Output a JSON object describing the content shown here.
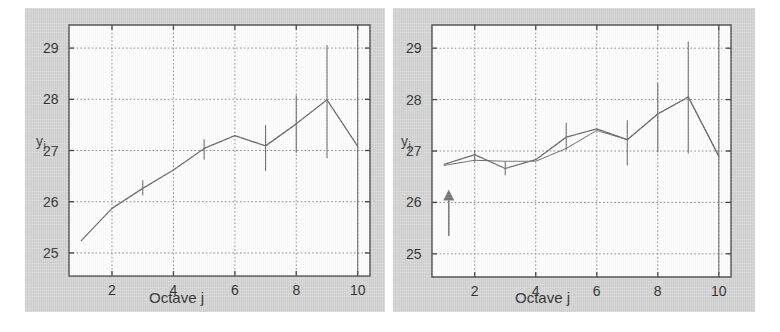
{
  "figure": {
    "background": "#d4d4d4",
    "plot_background": "#ffffff",
    "line_color": "#6b6b6b",
    "grid_color": "#8a8a8a",
    "axis_color": "#4a4a4a",
    "arrow_color": "#777777"
  },
  "panels": [
    {
      "id": "left",
      "name": "panel-left",
      "axis": {
        "xlabel": "Octave j",
        "ylabel": "y",
        "ylabel_sub": "j",
        "xticks": [
          "2",
          "4",
          "6",
          "8",
          "10"
        ],
        "xtick_values": [
          2,
          4,
          6,
          8,
          10
        ],
        "yticks": [
          "25",
          "26",
          "27",
          "28",
          "29"
        ],
        "ytick_values": [
          25,
          26,
          27,
          28,
          29
        ],
        "xlim": [
          0.6,
          10.4
        ],
        "ylim": [
          24.55,
          29.45
        ],
        "grid": true
      }
    },
    {
      "id": "right",
      "name": "panel-right",
      "axis": {
        "xlabel": "Octave j",
        "ylabel": "y",
        "ylabel_sub": "j",
        "xticks": [
          "2",
          "4",
          "6",
          "8",
          "10"
        ],
        "xtick_values": [
          2,
          4,
          6,
          8,
          10
        ],
        "yticks": [
          "25",
          "26",
          "27",
          "28",
          "29"
        ],
        "ytick_values": [
          25,
          26,
          27,
          28,
          29
        ],
        "xlim": [
          0.6,
          10.4
        ],
        "ylim": [
          24.55,
          29.45
        ],
        "grid": true
      },
      "annotation": {
        "type": "up-arrow",
        "name": "up-arrow-annotation",
        "x": 1.15,
        "y_tail": 25.35,
        "y_tip": 26.25
      }
    }
  ],
  "chart_data": [
    {
      "type": "line",
      "panel": "left",
      "title": "",
      "xlabel": "Octave j",
      "ylabel": "y_j",
      "xlim": [
        0.6,
        10.4
      ],
      "ylim": [
        24.55,
        29.45
      ],
      "grid": true,
      "legend": "none",
      "x": [
        1,
        2,
        3,
        4,
        5,
        6,
        7,
        8,
        9,
        10
      ],
      "series": [
        {
          "name": "y_j estimate",
          "values": [
            25.24,
            25.87,
            26.26,
            26.62,
            27.04,
            27.29,
            27.09,
            27.52,
            27.99,
            27.08
          ],
          "errorbars_low": [
            25.24,
            25.87,
            26.12,
            26.62,
            26.82,
            27.29,
            26.6,
            26.95,
            26.85,
            24.6
          ],
          "errorbars_high": [
            25.24,
            25.87,
            26.42,
            26.62,
            27.22,
            27.29,
            27.5,
            28.08,
            29.06,
            29.4
          ]
        }
      ]
    },
    {
      "type": "line",
      "panel": "right",
      "title": "",
      "xlabel": "Octave j",
      "ylabel": "y_j",
      "xlim": [
        0.6,
        10.4
      ],
      "ylim": [
        24.55,
        29.45
      ],
      "grid": true,
      "legend": "none",
      "x": [
        1,
        2,
        3,
        4,
        5,
        6,
        7,
        8,
        9,
        10
      ],
      "series": [
        {
          "name": "y_j estimate",
          "values": [
            26.74,
            26.93,
            26.66,
            26.83,
            27.27,
            27.43,
            27.22,
            27.72,
            28.05,
            26.9
          ],
          "errorbars_low": [
            26.74,
            26.78,
            26.53,
            26.83,
            27.02,
            27.43,
            26.72,
            26.97,
            26.95,
            24.62
          ],
          "errorbars_high": [
            26.74,
            27.02,
            26.8,
            26.83,
            27.55,
            27.43,
            27.6,
            28.32,
            29.13,
            29.38
          ]
        },
        {
          "name": "y_j fitted",
          "values": [
            26.72,
            26.82,
            26.8,
            26.8,
            27.05,
            27.4,
            27.22,
            27.72,
            28.05,
            26.9
          ]
        }
      ]
    }
  ]
}
